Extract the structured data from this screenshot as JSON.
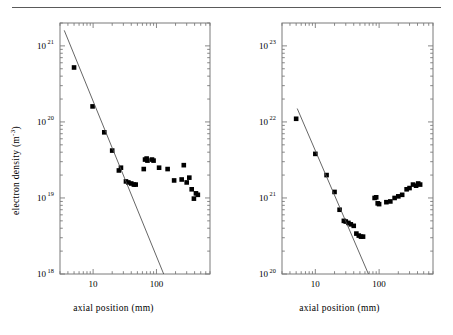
{
  "figure": {
    "rule": "horizontal-rule",
    "marker_color": "#000000",
    "fit_line_color": "#4a4a4a",
    "axis_color": "#7a7a7a"
  },
  "panels": [
    {
      "id": "left",
      "y_title_main": "electron density (m",
      "y_title_exp": "-3",
      "y_title_close": ")",
      "x_title": "axial position (mm)",
      "chart_data": {
        "type": "scatter",
        "title": "",
        "xlabel": "axial position (mm)",
        "ylabel": "electron density (m^-3)",
        "xscale": "log",
        "yscale": "log",
        "xlim": [
          3,
          700
        ],
        "ylim": [
          1e+18,
          2e+21
        ],
        "xticks": [
          10,
          100
        ],
        "xticklabels": [
          "10",
          "100"
        ],
        "yticks": [
          1e+18,
          1e+19,
          1e+20,
          1e+21
        ],
        "yticklabels": [
          "10^18",
          "10^19",
          "10^20",
          "10^21"
        ],
        "grid": false,
        "legend": false,
        "series": [
          {
            "name": "electron density measurements",
            "marker": "filled-square",
            "x": [
              5.0,
              9.8,
              15.0,
              20.0,
              25.5,
              27.5,
              33.0,
              36.0,
              40.0,
              44.0,
              47.0,
              63.0,
              66.0,
              70.0,
              72.0,
              85.0,
              90.0,
              110.0,
              150.0,
              190.0,
              250.0,
              270.0,
              300.0,
              330.0,
              360.0,
              390.0,
              420.0,
              450.0
            ],
            "y": [
              5.2e+20,
              1.6e+20,
              7.3e+19,
              4.2e+19,
              2.3e+19,
              2.5e+19,
              1.65e+19,
              1.6e+19,
              1.55e+19,
              1.5e+19,
              1.5e+19,
              2.4e+19,
              3.2e+19,
              3.3e+19,
              3.1e+19,
              3.2e+19,
              3.1e+19,
              2.5e+19,
              2.4e+19,
              1.7e+19,
              1.75e+19,
              2.7e+19,
              1.6e+19,
              1.85e+19,
              1.3e+19,
              9.8e+18,
              1.15e+19,
              1.1e+19
            ]
          },
          {
            "name": "power-law fit",
            "type": "line",
            "x": [
              3.5,
              130
            ],
            "y": [
              1.6e+21,
              1e+18
            ]
          }
        ]
      }
    },
    {
      "id": "right",
      "y_title_main": "neutral density (m",
      "y_title_exp": "-3",
      "y_title_close": ")",
      "x_title": "axial position (mm)",
      "chart_data": {
        "type": "scatter",
        "title": "",
        "xlabel": "axial position (mm)",
        "ylabel": "neutral density (m^-3)",
        "xscale": "log",
        "yscale": "log",
        "xlim": [
          3,
          700
        ],
        "ylim": [
          1e+20,
          2e+23
        ],
        "xticks": [
          10,
          100
        ],
        "xticklabels": [
          "10",
          "100"
        ],
        "yticks": [
          1e+20,
          1e+21,
          1e+22,
          1e+23
        ],
        "yticklabels": [
          "10^20",
          "10^21",
          "10^22",
          "10^23"
        ],
        "grid": false,
        "legend": false,
        "series": [
          {
            "name": "neutral density measurements",
            "marker": "filled-square",
            "x": [
              5.0,
              10.0,
              15.0,
              20.0,
              24.0,
              28.0,
              30.0,
              33.0,
              36.0,
              40.0,
              44.0,
              48.0,
              52.0,
              56.0,
              85.0,
              90.0,
              95.0,
              100.0,
              130.0,
              150.0,
              175.0,
              200.0,
              230.0,
              270.0,
              300.0,
              340.0,
              380.0,
              410.0,
              440.0
            ],
            "y": [
              1.1e+22,
              3.8e+21,
              2e+21,
              1.2e+21,
              7e+20,
              5e+20,
              4.9e+20,
              4.7e+20,
              4.5e+20,
              4.3e+20,
              3.4e+20,
              3.2e+20,
              3.1e+20,
              3.1e+20,
              1e+21,
              1.02e+21,
              8.5e+20,
              8.3e+20,
              8.8e+20,
              9e+20,
              1e+21,
              1.05e+21,
              1.1e+21,
              1.3e+21,
              1.35e+21,
              1.5e+21,
              1.45e+21,
              1.55e+21,
              1.5e+21
            ]
          },
          {
            "name": "power-law fit",
            "type": "line",
            "x": [
              5.2,
              68
            ],
            "y": [
              1.5e+22,
              1e+20
            ]
          }
        ]
      }
    }
  ]
}
